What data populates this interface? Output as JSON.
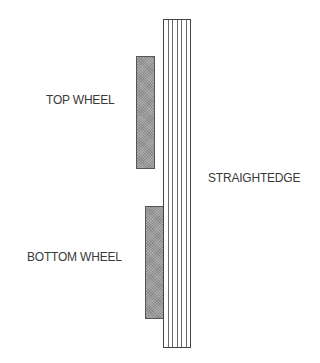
{
  "diagram": {
    "labels": {
      "top_wheel": "TOP WHEEL",
      "bottom_wheel": "BOTTOM WHEEL",
      "straightedge": "STRAIGHTEDGE"
    },
    "colors": {
      "background": "#ffffff",
      "wheel_fill": "#9a9a9a",
      "wheel_border": "#555555",
      "straightedge_border": "#444444",
      "text": "#3a3a3a"
    },
    "straightedge_lines": 5
  }
}
